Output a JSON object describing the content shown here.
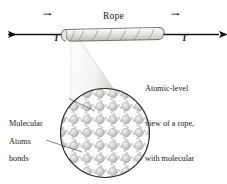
{
  "figure": {
    "name": "rope-tension-atomic-view",
    "background": "#ffffff",
    "line_color": "#1a1a1a"
  },
  "labels": {
    "rope": "Rope",
    "tension_left": "T",
    "tension_right": "T",
    "molecular_bonds_line1": "Molecular",
    "molecular_bonds_line2": "bonds",
    "atoms": "Atoms"
  },
  "caption": {
    "line1": "Atomic-level",
    "line2": "view of a rope,",
    "line3": "with molecular",
    "line4": "bonds as springs"
  },
  "diagram": {
    "rope": {
      "fill_light": "#f4f4f2",
      "fill_mid": "#d8d8d4",
      "stroke": "#4a4a48",
      "twist_count": 7
    },
    "cone": {
      "fill_light": "#ffffff",
      "fill_dark": "#b9b9b5"
    },
    "magnifier_circle": {
      "stroke": "#2a2a28",
      "cx": 105,
      "cy": 133,
      "r": 45
    },
    "lattice": {
      "atom_color": "#cccccc",
      "atom_edge": "#a8a8a8",
      "spring_color": "#b5b5b5",
      "pitch": 13,
      "atom_radius": 4.2,
      "rows": 8,
      "cols": 8
    },
    "arrows": {
      "color": "#111111",
      "left_direction": "left",
      "right_direction": "right"
    }
  }
}
